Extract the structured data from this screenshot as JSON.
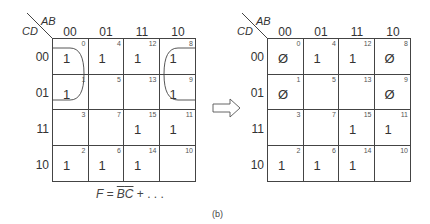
{
  "figure": {
    "caption": "(b)",
    "arrow_icon": "hollow-right-arrow"
  },
  "left_map": {
    "row_var": "CD",
    "col_var": "AB",
    "col_labels": [
      "00",
      "01",
      "11",
      "10"
    ],
    "row_labels": [
      "00",
      "01",
      "11",
      "10"
    ],
    "cells": [
      [
        {
          "idx": "0",
          "val": "1"
        },
        {
          "idx": "4",
          "val": "1"
        },
        {
          "idx": "12",
          "val": "1"
        },
        {
          "idx": "8",
          "val": "1"
        }
      ],
      [
        {
          "idx": "1",
          "val": "1"
        },
        {
          "idx": "5",
          "val": ""
        },
        {
          "idx": "13",
          "val": ""
        },
        {
          "idx": "9",
          "val": "1"
        }
      ],
      [
        {
          "idx": "3",
          "val": ""
        },
        {
          "idx": "7",
          "val": ""
        },
        {
          "idx": "15",
          "val": "1"
        },
        {
          "idx": "11",
          "val": "1"
        }
      ],
      [
        {
          "idx": "2",
          "val": "1"
        },
        {
          "idx": "6",
          "val": "1"
        },
        {
          "idx": "14",
          "val": "1"
        },
        {
          "idx": "10",
          "val": ""
        }
      ]
    ],
    "formula": {
      "prefix": "F = ",
      "term_b": "B",
      "term_c": "C",
      "suffix": " + . . ."
    },
    "grouping": "B'C' wrap-around group (cells 0,1,8,9)"
  },
  "right_map": {
    "row_var": "CD",
    "col_var": "AB",
    "col_labels": [
      "00",
      "01",
      "11",
      "10"
    ],
    "row_labels": [
      "00",
      "01",
      "11",
      "10"
    ],
    "cells": [
      [
        {
          "idx": "0",
          "val": "Ø"
        },
        {
          "idx": "4",
          "val": "1"
        },
        {
          "idx": "12",
          "val": "1"
        },
        {
          "idx": "8",
          "val": "Ø"
        }
      ],
      [
        {
          "idx": "1",
          "val": "Ø"
        },
        {
          "idx": "5",
          "val": ""
        },
        {
          "idx": "13",
          "val": ""
        },
        {
          "idx": "9",
          "val": "Ø"
        }
      ],
      [
        {
          "idx": "3",
          "val": ""
        },
        {
          "idx": "7",
          "val": ""
        },
        {
          "idx": "15",
          "val": "1"
        },
        {
          "idx": "11",
          "val": "1"
        }
      ],
      [
        {
          "idx": "2",
          "val": "1"
        },
        {
          "idx": "6",
          "val": "1"
        },
        {
          "idx": "14",
          "val": "1"
        },
        {
          "idx": "10",
          "val": ""
        }
      ]
    ]
  }
}
